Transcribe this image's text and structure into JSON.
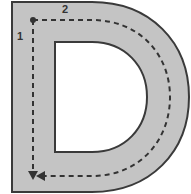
{
  "diagram": {
    "letter": "D",
    "stroke_labels": [
      {
        "id": "1",
        "text": "1"
      },
      {
        "id": "2",
        "text": "2"
      }
    ],
    "colors": {
      "fill": "#c4c4c4",
      "outline": "#3a3a3a",
      "guide": "#333333",
      "background": "#ffffff"
    }
  }
}
